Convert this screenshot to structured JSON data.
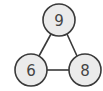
{
  "diagram": {
    "type": "graph",
    "colors": {
      "node_fill": "#ebebeb",
      "node_stroke": "#3a3a3a",
      "edge": "#3a3a3a",
      "text": "#444444"
    },
    "nodes": [
      {
        "id": "n9",
        "label": "9",
        "cx": 59,
        "cy": 20,
        "r": 16
      },
      {
        "id": "n6",
        "label": "6",
        "cx": 31,
        "cy": 70,
        "r": 16
      },
      {
        "id": "n8",
        "label": "8",
        "cx": 85,
        "cy": 70,
        "r": 16
      }
    ],
    "edges": [
      {
        "from": "n9",
        "to": "n6"
      },
      {
        "from": "n9",
        "to": "n8"
      },
      {
        "from": "n6",
        "to": "n8"
      }
    ]
  }
}
